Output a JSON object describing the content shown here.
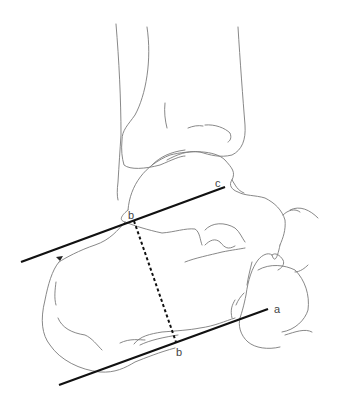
{
  "figure": {
    "type": "anatomical line drawing",
    "labels": {
      "point_c": "c",
      "point_b_upper": "b",
      "point_b_lower": "b",
      "point_a": "a"
    },
    "annotations": {
      "arrowhead": "arrowhead marker near upper-left line",
      "solid_lines": [
        "upper line b–c",
        "lower line through b to a"
      ],
      "dashed_line": "perpendicular b–b"
    },
    "colors": {
      "outline": "#7a7a7a",
      "measurement_lines": "#111111",
      "label_text": "#444444",
      "background": "#ffffff"
    }
  }
}
